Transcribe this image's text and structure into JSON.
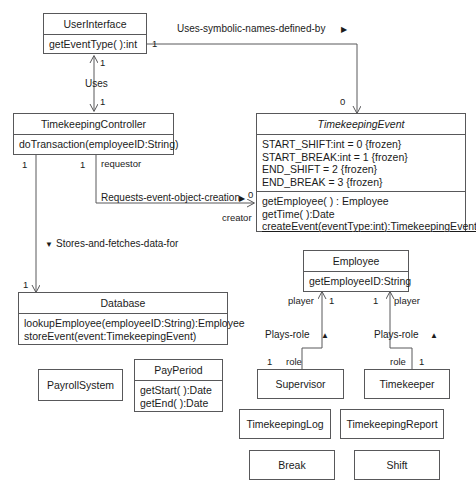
{
  "diagram": {
    "type": "uml-class-diagram",
    "background_color": "#ffffff",
    "line_color": "#58585a",
    "text_color": "#1b1b1b"
  },
  "classes": {
    "user_interface": {
      "name": "UserInterface",
      "abstract": false,
      "operations": [
        "getEventType( ):int"
      ]
    },
    "timekeeping_controller": {
      "name": "TimekeepingController",
      "abstract": false,
      "operations": [
        "doTransaction(employeeID:String)"
      ]
    },
    "timekeeping_event": {
      "name": "TimekeepingEvent",
      "abstract": true,
      "attributes": [
        "START_SHIFT:int = 0 {frozen}",
        "START_BREAK:int = 1 {frozen}",
        "END_SHIFT = 2 {frozen}",
        "END_BREAK = 3 {frozen}"
      ],
      "operations": [
        "getEmployee( ) : Employee",
        "getTime( ):Date",
        "createEvent(eventType:int):TimekeepingEvent"
      ],
      "static_operations": [
        "createEvent(eventType:int):TimekeepingEvent"
      ]
    },
    "database": {
      "name": "Database",
      "abstract": false,
      "operations": [
        "lookupEmployee(employeeID:String):Employee",
        "storeEvent(event:TimekeepingEvent)"
      ]
    },
    "employee": {
      "name": "Employee",
      "abstract": false,
      "operations": [
        "getEmployeeID:String"
      ]
    },
    "payroll_system": {
      "name": "PayrollSystem",
      "abstract": false
    },
    "pay_period": {
      "name": "PayPeriod",
      "abstract": false,
      "operations": [
        "getStart( ):Date",
        "getEnd( ):Date"
      ]
    },
    "supervisor": {
      "name": "Supervisor",
      "abstract": false
    },
    "timekeeper": {
      "name": "Timekeeper",
      "abstract": false
    },
    "timekeeping_log": {
      "name": "TimekeepingLog",
      "abstract": false
    },
    "timekeeping_report": {
      "name": "TimekeepingReport",
      "abstract": false
    },
    "break_class": {
      "name": "Break",
      "abstract": false
    },
    "shift_class": {
      "name": "Shift",
      "abstract": false
    }
  },
  "associations": {
    "uses_symbolic_names": {
      "label": "Uses-symbolic-names-defined-by",
      "navigation_arrow": "▶",
      "source_multiplicity": "1",
      "target_multiplicity": "0"
    },
    "uses": {
      "label": "Uses",
      "source_multiplicity": "1",
      "target_multiplicity": "1"
    },
    "requests_event_object_creation": {
      "label": "Requests-event-object-creation",
      "navigation_arrow": "▶",
      "source_multiplicity": "1",
      "target_multiplicity": "0",
      "source_role": "requestor",
      "target_role": "creator"
    },
    "stores_and_fetches": {
      "label": "Stores-and-fetches-data-for",
      "navigation_arrow": "▼",
      "source_multiplicity": "1",
      "target_multiplicity": "1"
    },
    "plays_role_supervisor": {
      "label": "Plays-role",
      "navigation_arrow": "▲",
      "player_role": "player",
      "player_multiplicity": "1",
      "role_role": "role",
      "role_multiplicity": "1"
    },
    "plays_role_timekeeper": {
      "label": "Plays-role",
      "navigation_arrow": "▲",
      "player_role": "player",
      "player_multiplicity": "1",
      "role_role": "role",
      "role_multiplicity": "1"
    }
  }
}
